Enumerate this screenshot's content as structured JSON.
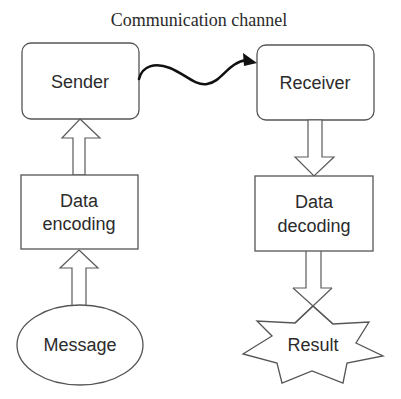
{
  "diagram": {
    "title": "Communication channel",
    "nodes": {
      "sender": {
        "label": "Sender",
        "shape": "rounded-rectangle"
      },
      "receiver": {
        "label": "Receiver",
        "shape": "rounded-rectangle"
      },
      "encoding": {
        "line1": "Data",
        "line2": "encoding",
        "shape": "rectangle"
      },
      "decoding": {
        "line1": "Data",
        "line2": "decoding",
        "shape": "rectangle"
      },
      "message": {
        "label": "Message",
        "shape": "ellipse"
      },
      "result": {
        "label": "Result",
        "shape": "star"
      }
    },
    "edges": [
      {
        "from": "Message",
        "to": "Data encoding",
        "style": "hollow-block-arrow"
      },
      {
        "from": "Data encoding",
        "to": "Sender",
        "style": "hollow-block-arrow"
      },
      {
        "from": "Sender",
        "to": "Receiver",
        "style": "wavy-arrow",
        "label": "Communication channel"
      },
      {
        "from": "Receiver",
        "to": "Data decoding",
        "style": "hollow-block-arrow"
      },
      {
        "from": "Data decoding",
        "to": "Result",
        "style": "hollow-block-arrow"
      }
    ],
    "colors": {
      "stroke": "#555555",
      "text": "#2b2b2b",
      "background": "#ffffff",
      "wave": "#111111"
    }
  }
}
